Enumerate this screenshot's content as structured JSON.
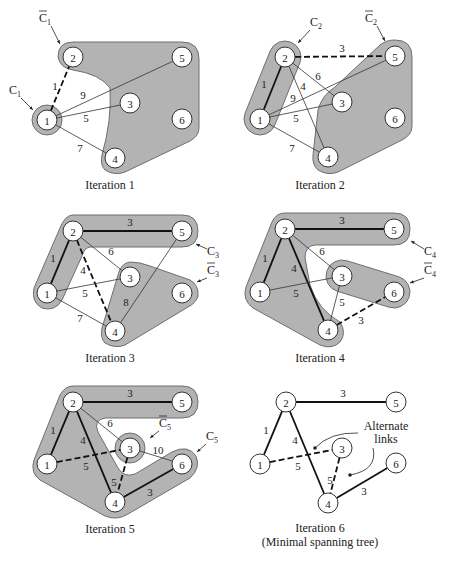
{
  "figure": {
    "background": "#ffffff",
    "region_color": "#b3b3b3",
    "panels": [
      {
        "id": "iteration-1",
        "caption": "Iteration 1",
        "caption_pos": [
          110,
          189
        ],
        "nodes": {
          "1": [
            47,
            120
          ],
          "2": [
            73,
            57
          ],
          "3": [
            130,
            103
          ],
          "4": [
            115,
            158
          ],
          "5": [
            182,
            57
          ],
          "6": [
            182,
            119
          ]
        },
        "regions": [
          {
            "type": "ring",
            "center": [
              47,
              120
            ],
            "r": 15,
            "label": "C1"
          },
          {
            "type": "path",
            "d": "M 73 42 L 182 42 Q 199 42 199 59 L 199 128 Q 199 136 190 141 L 125 172 Q 115 176 105 170 Q 100 165 102 155 Q 112 120 110 88 Q 100 74 73 70 Q 60 68 58 57 Q 58 42 73 42 Z",
            "label": "C1-bar"
          }
        ],
        "edges": [
          {
            "from": "1",
            "to": "2",
            "w": "1",
            "style": "dash",
            "label_pos": [
              55,
              86
            ]
          },
          {
            "from": "1",
            "to": "5",
            "w": "9",
            "style": "thin",
            "label_pos": [
              83,
              95
            ]
          },
          {
            "from": "1",
            "to": "3",
            "w": "5",
            "style": "thin",
            "label_pos": [
              86,
              118
            ]
          },
          {
            "from": "1",
            "to": "4",
            "w": "7",
            "style": "thin",
            "label_pos": [
              80,
              148
            ]
          }
        ],
        "cut_labels": [
          {
            "text": "C",
            "sub": "1",
            "bar": true,
            "pos": [
              45,
              22
            ],
            "arrow_to": [
              60,
              44
            ]
          },
          {
            "text": "C",
            "sub": "1",
            "bar": false,
            "pos": [
              15,
              94
            ],
            "arrow_to": [
              33,
              110
            ]
          }
        ]
      },
      {
        "id": "iteration-2",
        "caption": "Iteration 2",
        "caption_pos": [
          320,
          189
        ],
        "nodes": {
          "1": [
            260,
            119
          ],
          "2": [
            285,
            57
          ],
          "3": [
            342,
            102
          ],
          "4": [
            328,
            157
          ],
          "5": [
            395,
            56
          ],
          "6": [
            395,
            118
          ]
        },
        "regions": [
          {
            "type": "capsule",
            "a": [
              260,
              119
            ],
            "b": [
              285,
              57
            ],
            "r": 16,
            "label": "C2"
          },
          {
            "type": "path",
            "d": "M 395 40 Q 412 40 412 57 L 412 126 Q 412 135 402 140 L 338 172 Q 328 176 318 170 Q 312 165 313 155 L 318 110 Q 322 95 335 87 L 380 45 Q 386 40 395 40 Z",
            "label": "C2-bar"
          }
        ],
        "edges": [
          {
            "from": "2",
            "to": "5",
            "w": "3",
            "style": "dash",
            "label_pos": [
              342,
              48
            ]
          },
          {
            "from": "2",
            "to": "1",
            "w": "1",
            "style": "bold",
            "label_pos": [
              264,
              84
            ]
          },
          {
            "from": "2",
            "to": "3",
            "w": "6",
            "style": "thin",
            "label_pos": [
              318,
              76
            ]
          },
          {
            "from": "2",
            "to": "4",
            "w": "4",
            "style": "thin",
            "label_pos": [
              303,
              86
            ]
          },
          {
            "from": "1",
            "to": "5",
            "w": "9",
            "style": "thin",
            "label_pos": [
              293,
              98
            ]
          },
          {
            "from": "1",
            "to": "3",
            "w": "5",
            "style": "thin",
            "label_pos": [
              296,
              118
            ]
          },
          {
            "from": "1",
            "to": "4",
            "w": "7",
            "style": "thin",
            "label_pos": [
              292,
              148
            ]
          }
        ],
        "cut_labels": [
          {
            "text": "C",
            "sub": "2",
            "bar": false,
            "pos": [
              316,
              26
            ],
            "arrow_to": [
              298,
              43
            ]
          },
          {
            "text": "C",
            "sub": "2",
            "bar": true,
            "pos": [
              371,
              22
            ],
            "arrow_to": [
              385,
              41
            ]
          }
        ]
      },
      {
        "id": "iteration-3",
        "caption": "Iteration 3",
        "caption_pos": [
          110,
          362
        ],
        "nodes": {
          "1": [
            47,
            293
          ],
          "2": [
            73,
            231
          ],
          "3": [
            130,
            277
          ],
          "4": [
            115,
            331
          ],
          "5": [
            182,
            231
          ],
          "6": [
            182,
            293
          ]
        },
        "regions": [
          {
            "type": "path",
            "d": "M 73 215 L 182 215 Q 198 215 198 231 Q 198 247 182 247 L 90 247 Q 84 248 82 256 L 62 300 Q 55 312 42 308 Q 31 302 34 288 L 60 228 Q 65 215 73 215 Z",
            "label": "C3"
          },
          {
            "type": "path",
            "d": "M 130 262 Q 140 262 150 266 L 190 280 Q 199 285 198 296 Q 196 303 188 307 L 125 345 Q 115 349 105 343 Q 100 338 102 328 L 118 275 Q 121 263 130 262 Z",
            "label": "C3-bar"
          }
        ],
        "edges": [
          {
            "from": "2",
            "to": "5",
            "w": "3",
            "style": "bold",
            "label_pos": [
              130,
              222
            ]
          },
          {
            "from": "2",
            "to": "1",
            "w": "1",
            "style": "bold",
            "label_pos": [
              53,
              258
            ]
          },
          {
            "from": "2",
            "to": "3",
            "w": "6",
            "style": "thin",
            "label_pos": [
              111,
              251
            ]
          },
          {
            "from": "2",
            "to": "4",
            "w": "4",
            "style": "dash",
            "label_pos": [
              83,
              270
            ]
          },
          {
            "from": "1",
            "to": "3",
            "w": "5",
            "style": "thin",
            "label_pos": [
              85,
              293
            ]
          },
          {
            "from": "1",
            "to": "4",
            "w": "7",
            "style": "thin",
            "label_pos": [
              80,
              318
            ]
          },
          {
            "from": "5",
            "to": "4",
            "w": "8",
            "style": "thin",
            "label_pos": [
              126,
              302
            ]
          }
        ],
        "cut_labels": [
          {
            "text": "C",
            "sub": "3",
            "bar": false,
            "pos": [
              213,
              255
            ],
            "arrow_to": [
              196,
              244
            ]
          },
          {
            "text": "C",
            "sub": "3",
            "bar": true,
            "pos": [
              213,
              274
            ],
            "arrow_to": [
              197,
              282
            ]
          }
        ]
      },
      {
        "id": "iteration-4",
        "caption": "Iteration 4",
        "caption_pos": [
          320,
          362
        ],
        "nodes": {
          "1": [
            260,
            292
          ],
          "2": [
            285,
            229
          ],
          "3": [
            342,
            276
          ],
          "4": [
            328,
            330
          ],
          "5": [
            394,
            229
          ],
          "6": [
            394,
            292
          ]
        },
        "regions": [
          {
            "type": "path",
            "d": "M 285 213 L 394 213 Q 410 213 410 229 Q 410 245 394 245 L 315 245 Q 305 246 305 258 L 310 285 Q 318 310 340 322 Q 347 333 340 342 Q 332 350 320 345 L 253 308 Q 242 300 246 287 L 272 222 Q 276 213 285 213 Z",
            "label": "C4"
          },
          {
            "type": "capsule",
            "a": [
              342,
              276
            ],
            "b": [
              394,
              292
            ],
            "r": 16,
            "label": "C4-bar"
          }
        ],
        "edges": [
          {
            "from": "2",
            "to": "5",
            "w": "3",
            "style": "bold",
            "label_pos": [
              342,
              220
            ]
          },
          {
            "from": "2",
            "to": "1",
            "w": "1",
            "style": "bold",
            "label_pos": [
              265,
              258
            ]
          },
          {
            "from": "2",
            "to": "4",
            "w": "4",
            "style": "bold",
            "label_pos": [
              294,
              268
            ]
          },
          {
            "from": "2",
            "to": "3",
            "w": "6",
            "style": "thin",
            "label_pos": [
              322,
              251
            ]
          },
          {
            "from": "1",
            "to": "3",
            "w": "5",
            "style": "thin",
            "label_pos": [
              296,
              293
            ]
          },
          {
            "from": "3",
            "to": "4",
            "w": "5",
            "style": "thin",
            "label_pos": [
              342,
              302
            ]
          },
          {
            "from": "4",
            "to": "6",
            "w": "3",
            "style": "dash",
            "label_pos": [
              361,
              320
            ]
          }
        ],
        "cut_labels": [
          {
            "text": "C",
            "sub": "4",
            "bar": false,
            "pos": [
              430,
              255
            ],
            "arrow_to": [
              411,
              241
            ]
          },
          {
            "text": "C",
            "sub": "4",
            "bar": true,
            "pos": [
              430,
              274
            ],
            "arrow_to": [
              410,
              283
            ]
          }
        ]
      },
      {
        "id": "iteration-5",
        "caption": "Iteration 5",
        "caption_pos": [
          110,
          533
        ],
        "nodes": {
          "1": [
            47,
            464
          ],
          "2": [
            73,
            402
          ],
          "3": [
            130,
            448
          ],
          "4": [
            115,
            502
          ],
          "5": [
            182,
            402
          ],
          "6": [
            182,
            464
          ]
        },
        "regions": [
          {
            "type": "path",
            "d": "M 73 386 L 182 386 Q 198 386 198 402 Q 198 418 182 418 L 105 418 Q 93 420 98 432 L 118 468 Q 124 478 135 474 L 172 452 Q 188 444 196 456 Q 201 468 190 478 L 128 514 Q 117 521 105 516 L 40 480 Q 30 473 34 460 L 60 395 Q 65 386 73 386 Z",
            "label": "C5"
          },
          {
            "type": "ring",
            "center": [
              130,
              448
            ],
            "r": 15,
            "label": "C5-bar"
          }
        ],
        "edges": [
          {
            "from": "2",
            "to": "5",
            "w": "3",
            "style": "bold",
            "label_pos": [
              130,
              393
            ]
          },
          {
            "from": "2",
            "to": "1",
            "w": "1",
            "style": "bold",
            "label_pos": [
              53,
              430
            ]
          },
          {
            "from": "2",
            "to": "4",
            "w": "4",
            "style": "bold",
            "label_pos": [
              83,
              440
            ]
          },
          {
            "from": "2",
            "to": "3",
            "w": "6",
            "style": "thin",
            "label_pos": [
              110,
              423
            ]
          },
          {
            "from": "1",
            "to": "3",
            "w": "5",
            "style": "dash",
            "label_pos": [
              86,
              466
            ]
          },
          {
            "from": "3",
            "to": "4",
            "w": "5",
            "style": "dash",
            "label_pos": [
              114,
              482
            ]
          },
          {
            "from": "3",
            "to": "6",
            "w": "10",
            "style": "thin",
            "label_pos": [
              158,
              450
            ]
          },
          {
            "from": "4",
            "to": "6",
            "w": "3",
            "style": "bold",
            "label_pos": [
              150,
              492
            ]
          }
        ],
        "cut_labels": [
          {
            "text": "C",
            "sub": "5",
            "bar": true,
            "pos": [
              165,
              427
            ],
            "arrow_to": [
              150,
              438
            ]
          },
          {
            "text": "C",
            "sub": "5",
            "bar": false,
            "pos": [
              212,
              440
            ],
            "arrow_to": [
              197,
              452
            ]
          }
        ]
      },
      {
        "id": "iteration-6",
        "caption": "Iteration 6",
        "caption_sub": "(Minimal spanning tree)",
        "caption_pos": [
          320,
          532
        ],
        "nodes": {
          "1": [
            260,
            464
          ],
          "2": [
            286,
            402
          ],
          "3": [
            342,
            448
          ],
          "4": [
            328,
            503
          ],
          "5": [
            396,
            402
          ],
          "6": [
            396,
            463
          ]
        },
        "regions": [],
        "edges": [
          {
            "from": "2",
            "to": "5",
            "w": "3",
            "style": "bold",
            "label_pos": [
              343,
              393
            ]
          },
          {
            "from": "2",
            "to": "1",
            "w": "1",
            "style": "bold",
            "label_pos": [
              266,
              430
            ]
          },
          {
            "from": "2",
            "to": "4",
            "w": "4",
            "style": "bold",
            "label_pos": [
              295,
              440
            ]
          },
          {
            "from": "1",
            "to": "3",
            "w": "5",
            "style": "dash",
            "label_pos": [
              298,
              466
            ]
          },
          {
            "from": "3",
            "to": "4",
            "w": "5",
            "style": "dash",
            "label_pos": [
              330,
              480
            ]
          },
          {
            "from": "4",
            "to": "6",
            "w": "3",
            "style": "bold",
            "label_pos": [
              364,
              491
            ]
          }
        ],
        "annotation": {
          "lines": [
            "Alternate",
            "links"
          ],
          "pos": [
            386,
            430
          ],
          "arrows": [
            {
              "d": "M 358 433 Q 330 432 315 448",
              "tip": [
                315,
                448
              ]
            },
            {
              "d": "M 373 448 Q 378 470 350 475",
              "tip": [
                350,
                475
              ]
            }
          ]
        },
        "cut_labels": []
      }
    ]
  }
}
